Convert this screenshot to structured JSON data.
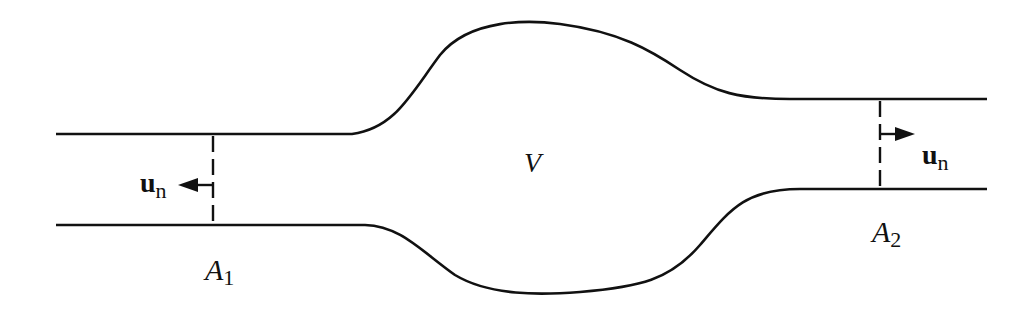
{
  "diagram": {
    "colors": {
      "stroke": "#111111",
      "background": "#ffffff"
    },
    "labels": {
      "volume": "V",
      "area_inlet_main": "A",
      "area_inlet_sub": "1",
      "area_outlet_main": "A",
      "area_outlet_sub": "2",
      "un_left_main": "u",
      "un_left_sub": "n",
      "un_right_main": "u",
      "un_right_sub": "n"
    },
    "icons": {
      "left_arrow": "arrow-left-icon",
      "right_arrow": "arrow-right-icon"
    }
  }
}
